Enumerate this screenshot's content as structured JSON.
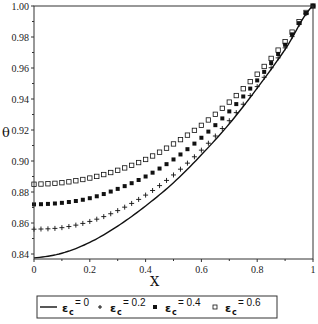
{
  "chart_data": {
    "type": "line",
    "title": "",
    "xlabel": "X",
    "ylabel": "θ",
    "xlim": [
      0,
      1
    ],
    "ylim": [
      0.837,
      1.0
    ],
    "x_ticks": [
      "0",
      "0.2",
      "0.4",
      "0.6",
      "0.8",
      "1"
    ],
    "y_ticks": [
      "0.84",
      "0.86",
      "0.88",
      "0.90",
      "0.92",
      "0.94",
      "0.96",
      "0.98",
      "1.00"
    ],
    "grid": false,
    "legend_position": "bottom",
    "x": [
      0,
      0.1,
      0.2,
      0.3,
      0.4,
      0.5,
      0.6,
      0.7,
      0.8,
      0.9,
      1.0
    ],
    "series": [
      {
        "name": "εc = 0",
        "marker": "line",
        "values": [
          0.8375,
          0.8405,
          0.8475,
          0.858,
          0.871,
          0.886,
          0.904,
          0.924,
          0.947,
          0.972,
          1.0
        ]
      },
      {
        "name": "εc = 0.2",
        "marker": "plus",
        "values": [
          0.856,
          0.857,
          0.861,
          0.868,
          0.878,
          0.891,
          0.907,
          0.926,
          0.948,
          0.973,
          1.0
        ]
      },
      {
        "name": "εc = 0.4",
        "marker": "filled-square",
        "values": [
          0.872,
          0.873,
          0.876,
          0.882,
          0.89,
          0.901,
          0.915,
          0.932,
          0.952,
          0.975,
          1.0
        ]
      },
      {
        "name": "εc = 0.6",
        "marker": "open-square",
        "values": [
          0.885,
          0.886,
          0.889,
          0.894,
          0.901,
          0.911,
          0.923,
          0.938,
          0.956,
          0.977,
          1.0
        ]
      }
    ]
  },
  "legend": {
    "items": [
      {
        "symbol": "ε",
        "sub": "c",
        "value": "= 0"
      },
      {
        "symbol": "ε",
        "sub": "c",
        "value": "= 0.2"
      },
      {
        "symbol": "ε",
        "sub": "c",
        "value": "= 0.4"
      },
      {
        "symbol": "ε",
        "sub": "c",
        "value": "= 0.6"
      }
    ]
  },
  "axes": {
    "xlabel": "X",
    "ylabel": "θ"
  }
}
